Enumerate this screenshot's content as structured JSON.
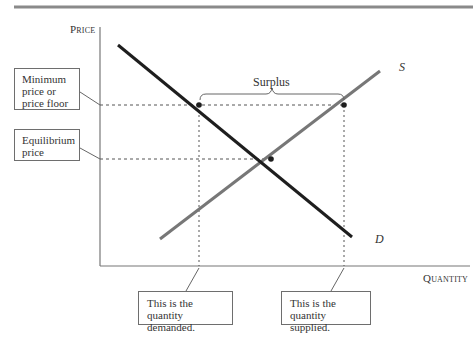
{
  "diagram": {
    "type": "supply-demand-price-floor",
    "axes": {
      "y_label": "Price",
      "x_label": "Quantity"
    },
    "curves": {
      "demand_label": "D",
      "supply_label": "S"
    },
    "annotations": {
      "surplus": "Surplus",
      "price_floor": "Minimum price or price floor",
      "price_floor_lines": [
        "Minimum",
        "price or",
        "price floor"
      ],
      "equilibrium_price_lines": [
        "Equilibrium",
        "price"
      ],
      "quantity_demanded_lines": [
        "This is the",
        "quantity demanded."
      ],
      "quantity_supplied_lines": [
        "This is the",
        "quantity supplied."
      ]
    },
    "colors": {
      "demand": "#1e1e1e",
      "supply": "#777777",
      "axis": "#777777",
      "rule": "#8a8a8a",
      "guides": "#555555"
    }
  }
}
